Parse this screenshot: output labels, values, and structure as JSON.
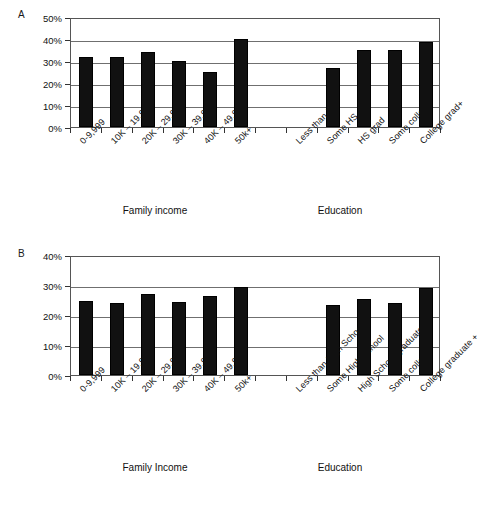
{
  "figure": {
    "background_color": "#ffffff",
    "bar_color": "#111111",
    "gridline_color": "#6f6f6f",
    "axis_color": "#333333"
  },
  "panels": [
    {
      "letter": "A",
      "y_ticks": [
        "0%",
        "10%",
        "20%",
        "30%",
        "40%",
        "50%"
      ],
      "group_captions": [
        "Family income",
        "Education"
      ],
      "categories": [
        "0-9,999",
        "10K – 19,999",
        "20K – 29,999",
        "30K – 39,999",
        "40K – 49,999",
        "50k+",
        "",
        "Less than HS",
        "Some HS",
        "HS grad",
        "Some college",
        "College grad+"
      ]
    },
    {
      "letter": "B",
      "y_ticks": [
        "0%",
        "10%",
        "20%",
        "30%",
        "40%"
      ],
      "group_captions": [
        "Family Income",
        "Education"
      ],
      "categories": [
        "0-9,999",
        "10K – 19,999",
        "20K – 29,999",
        "30K – 39,999",
        "40K – 49,999",
        "50k+",
        "",
        "Less than High School",
        "Some High School",
        "High School graduate",
        "Some college",
        "College graduate +"
      ]
    }
  ],
  "chart_data": [
    {
      "type": "bar",
      "title": "A",
      "xlabel": "",
      "ylabel": "",
      "ylim": [
        0,
        50
      ],
      "ytick_values": [
        0,
        10,
        20,
        30,
        40,
        50
      ],
      "ytick_labels": [
        "0%",
        "10%",
        "20%",
        "30%",
        "40%",
        "50%"
      ],
      "grid": true,
      "legend": "none",
      "units": "percent",
      "group_captions": [
        "Family income",
        "Education"
      ],
      "categories": [
        "0-9,999",
        "10K – 19,999",
        "20K – 29,999",
        "30K – 39,999",
        "40K – 49,999",
        "50k+",
        "",
        "Less than HS",
        "Some HS",
        "HS grad",
        "Some college",
        "College grad+"
      ],
      "values": [
        32,
        32,
        34,
        30,
        25,
        40,
        null,
        null,
        27,
        34.8,
        34.8,
        38.8,
        31.4
      ]
    },
    {
      "type": "bar",
      "title": "B",
      "xlabel": "",
      "ylabel": "",
      "ylim": [
        0,
        40
      ],
      "ytick_values": [
        0,
        10,
        20,
        30,
        40
      ],
      "ytick_labels": [
        "0%",
        "10%",
        "20%",
        "30%",
        "40%"
      ],
      "grid": true,
      "legend": "none",
      "units": "percent",
      "group_captions": [
        "Family Income",
        "Education"
      ],
      "categories": [
        "0-9,999",
        "10K – 19,999",
        "20K – 29,999",
        "30K – 39,999",
        "40K – 49,999",
        "50k+",
        "",
        "Less than High School",
        "Some High School",
        "High School graduate",
        "Some college",
        "College graduate +"
      ],
      "values": [
        24.7,
        24.0,
        27.1,
        24.4,
        26.2,
        29.5,
        null,
        null,
        23.5,
        25.2,
        23.9,
        29.1,
        30.7
      ]
    }
  ]
}
